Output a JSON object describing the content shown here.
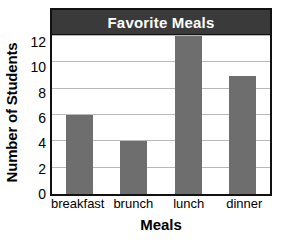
{
  "chart_data": {
    "type": "bar",
    "title": "Favorite Meals",
    "xlabel": "Meals",
    "ylabel": "Number of Students",
    "categories": [
      "breakfast",
      "brunch",
      "lunch",
      "dinner"
    ],
    "values": [
      6,
      4,
      12,
      9
    ],
    "ylim": [
      0,
      12
    ],
    "ytick_labels": [
      "0",
      "2",
      "4",
      "6",
      "8",
      "10",
      "12"
    ],
    "ytick_values": [
      0,
      2,
      4,
      6,
      8,
      10,
      12
    ],
    "grid": "horizontal",
    "legend": "none",
    "colors": {
      "bar_fill": "#6e6e6e",
      "title_banner": "#3a3a3a",
      "title_text": "#ffffff",
      "gridline": "#b9b9b9",
      "frame": "#111111",
      "background": "#ffffff",
      "text": "#000000"
    }
  }
}
